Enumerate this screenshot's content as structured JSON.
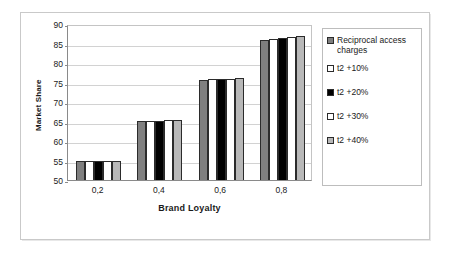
{
  "chart_data": {
    "type": "bar",
    "title": "",
    "xlabel": "Brand Loyalty",
    "ylabel": "Market Share",
    "categories": [
      "0,2",
      "0,4",
      "0,6",
      "0,8"
    ],
    "ylim": [
      50,
      90
    ],
    "yticks": [
      50,
      55,
      60,
      65,
      70,
      75,
      80,
      85,
      90
    ],
    "grid": true,
    "legend_position": "right",
    "series": [
      {
        "name": "Reciprocal access charges",
        "swatch": "gray",
        "color": "#7f7f7f",
        "values": [
          55.0,
          65.2,
          75.6,
          86.0
        ]
      },
      {
        "name": "t2 +10%",
        "swatch": "white",
        "color": "#ffffff",
        "values": [
          55.0,
          65.2,
          75.8,
          86.1
        ]
      },
      {
        "name": "t2 +20%",
        "swatch": "black",
        "color": "#000000",
        "values": [
          55.0,
          65.2,
          75.8,
          86.4
        ]
      },
      {
        "name": "t2 +30%",
        "swatch": "white",
        "color": "#ffffff",
        "values": [
          54.9,
          65.4,
          76.0,
          86.7
        ]
      },
      {
        "name": "t2 +40%",
        "swatch": "lgray",
        "color": "#b8b8b8",
        "values": [
          54.8,
          65.4,
          76.2,
          86.9
        ]
      }
    ]
  },
  "axis": {
    "y_title": "Market Share",
    "x_title": "Brand Loyalty",
    "y_tick_labels": [
      "90",
      "85",
      "80",
      "75",
      "70",
      "65",
      "60",
      "55",
      "50"
    ],
    "x_tick_labels": [
      "0,2",
      "0,4",
      "0,6",
      "0,8"
    ]
  },
  "legend": {
    "items": [
      {
        "label": "Reciprocal access charges",
        "swatch": "gray"
      },
      {
        "label": "t2 +10%",
        "swatch": "white"
      },
      {
        "label": "t2 +20%",
        "swatch": "black"
      },
      {
        "label": "t2 +30%",
        "swatch": "white"
      },
      {
        "label": "t2 +40%",
        "swatch": "lgray"
      }
    ]
  }
}
